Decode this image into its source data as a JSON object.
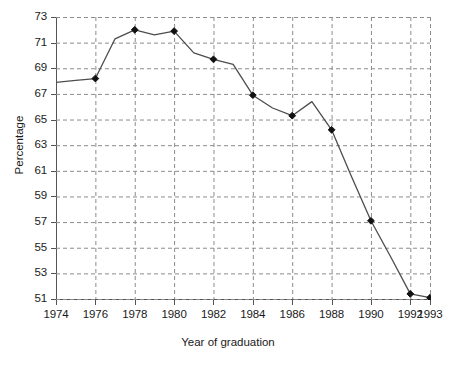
{
  "chart_data": {
    "type": "line",
    "title": "",
    "xlabel": "Year of graduation",
    "ylabel": "Percentage",
    "xlim": [
      1974,
      1993
    ],
    "ylim": [
      51,
      73
    ],
    "grid": true,
    "grid_style": "dashed",
    "legend": "none",
    "yticks": [
      73,
      71,
      69,
      67,
      65,
      63,
      61,
      59,
      57,
      55,
      53,
      51
    ],
    "xticks": [
      1974,
      1976,
      1978,
      1980,
      1982,
      1984,
      1986,
      1988,
      1990,
      1992,
      1993
    ],
    "ytick_labels": [
      "73",
      "71",
      "69",
      "67",
      "65",
      "63",
      "61",
      "59",
      "57",
      "55",
      "53",
      "51"
    ],
    "xtick_labels": [
      "1974",
      "1976",
      "1978",
      "1980",
      "1982",
      "1984",
      "1986",
      "1988",
      "1990",
      "1992",
      "1993"
    ],
    "series": [
      {
        "name": "Percentage",
        "color": "#4d4d4d",
        "marker": "diamond",
        "marker_color": "#111111",
        "x": [
          1974,
          1975,
          1976,
          1977,
          1978,
          1979,
          1980,
          1981,
          1982,
          1983,
          1984,
          1985,
          1986,
          1987,
          1988,
          1989,
          1990,
          1991,
          1992,
          1993
        ],
        "values": [
          67.9,
          68.05,
          68.2,
          71.3,
          72.0,
          71.6,
          71.9,
          70.2,
          69.7,
          69.3,
          66.9,
          65.9,
          65.3,
          66.4,
          64.2,
          60.6,
          57.1,
          54.3,
          51.4,
          51.1
        ],
        "marker_years": [
          1976,
          1978,
          1980,
          1982,
          1984,
          1986,
          1988,
          1990,
          1992,
          1993
        ]
      }
    ]
  },
  "axes": {
    "y_title": "Percentage",
    "x_title": "Year of graduation"
  }
}
